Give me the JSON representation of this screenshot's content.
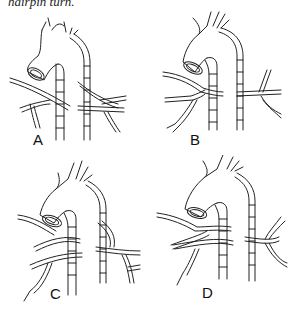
{
  "caption": "hairpin turn.",
  "panels": [
    {
      "label": "A"
    },
    {
      "label": "B"
    },
    {
      "label": "C"
    },
    {
      "label": "D"
    }
  ]
}
